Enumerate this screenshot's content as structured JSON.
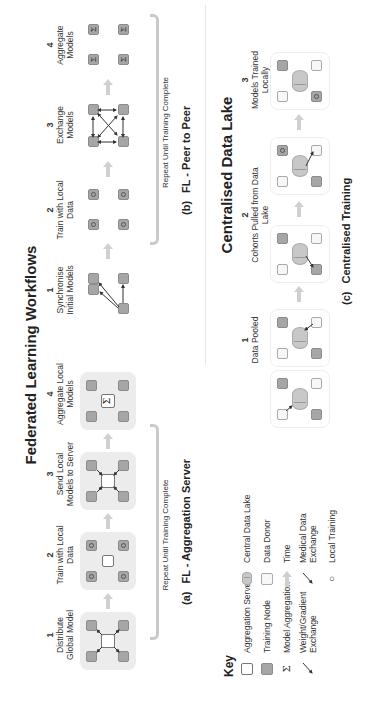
{
  "title_federated": "Federated Learning Workflows",
  "title_centralised": "Centralised Data Lake",
  "panel_a": {
    "letter": "(a)",
    "caption": "FL - Aggregation Server",
    "repeat_label": "Repeat Until Training Complete",
    "steps": [
      {
        "num": "1",
        "label": "Distribute Global Model"
      },
      {
        "num": "2",
        "label": "Train with Local Data"
      },
      {
        "num": "3",
        "label": "Send Local Models to Server"
      },
      {
        "num": "4",
        "label": "Aggregate Local Models"
      }
    ]
  },
  "panel_b": {
    "letter": "(b)",
    "caption": "FL - Peer to Peer",
    "repeat_label": "Repeat Until Training Complete",
    "steps": [
      {
        "num": "1",
        "label": "Synchronise Initial Models"
      },
      {
        "num": "2",
        "label": "Train with Local Data"
      },
      {
        "num": "3",
        "label": "Exchange Models"
      },
      {
        "num": "4",
        "label": "Aggregate Models"
      }
    ]
  },
  "panel_c": {
    "letter": "(c)",
    "caption": "Centralised Training",
    "steps": [
      {
        "num": "1",
        "label": "Data Pooled"
      },
      {
        "num": "2",
        "label": "Cohorts Pulled from Data Lake"
      },
      {
        "num": "3",
        "label": "Models Trained Locally"
      }
    ]
  },
  "key": {
    "title": "Key",
    "items": [
      {
        "icon": "aggregation-server-icon",
        "label": "Aggregation Server"
      },
      {
        "icon": "training-node-icon",
        "label": "Training Node"
      },
      {
        "icon": "sigma-icon",
        "symbol": "Σ",
        "label": "Model Aggregation"
      },
      {
        "icon": "arrow-icon",
        "label": "Weight/Gradient Exchange"
      },
      {
        "icon": "central-data-lake-icon",
        "label": "Central Data Lake"
      },
      {
        "icon": "data-donor-icon",
        "label": "Data Donor"
      },
      {
        "icon": "time-arrow-icon",
        "label": "Time"
      },
      {
        "icon": "arrow-icon",
        "label": "Medical Data Exchange"
      },
      {
        "icon": "circle-icon",
        "symbol": "○",
        "label": "Local Training"
      }
    ]
  },
  "symbols": {
    "sigma": "Σ"
  },
  "colors": {
    "node_fill": "#a6a6a6",
    "stage_bg": "#ececec",
    "arrow_gray": "#d0d0d0",
    "bracket": "#c9c9c9",
    "text": "#222222"
  }
}
